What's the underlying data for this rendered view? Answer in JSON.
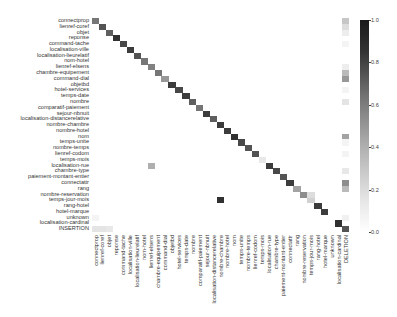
{
  "chart_data": {
    "type": "heatmap",
    "title": "",
    "xlabel": "",
    "ylabel": "",
    "rows": [
      "connectprop",
      "lienref-coref",
      "objet",
      "reponse",
      "command-tache",
      "localisation-ville",
      "localisation-lieurelatif",
      "nom-hotel",
      "lienref-elsens",
      "chambre-equipement",
      "command-dial",
      "objetbd",
      "hotel-services",
      "temps-date",
      "nombre",
      "comparatif-paiement",
      "sejour-nbnuit",
      "localisation-distancerelative",
      "nombre-chambre",
      "nombre-hotel",
      "nom",
      "temps-unite",
      "nombre-temps",
      "lienref-codom",
      "temps-mois",
      "localisation-rue",
      "chambre-type",
      "paiement-montant-entier",
      "connectattr",
      "rang",
      "nombre-reservation",
      "temps-jour-mois",
      "rang-hotel",
      "hotel-marque",
      "unknown",
      "localisation-cardinal",
      "INSERTION"
    ],
    "columns": [
      "connectprop",
      "lienref-coref",
      "objet",
      "reponse",
      "command-tache",
      "localisation-ville",
      "localisation-lieurelatif",
      "nom-hotel",
      "lienref-elsens",
      "chambre-equipement",
      "command-dial",
      "objetbd",
      "hotel-services",
      "temps-date",
      "nombre",
      "comparatif-paiement",
      "sejour-nbnuit",
      "localisation-distancerelative",
      "nombre-chambre",
      "nombre-hotel",
      "nom",
      "temps-unite",
      "nombre-temps",
      "lienref-codom",
      "temps-mois",
      "localisation-rue",
      "chambre-type",
      "paiement-montant-entier",
      "connectattr",
      "rang",
      "nombre-reservation",
      "temps-jour-mois",
      "rang-hotel",
      "hotel-marque",
      "unknown",
      "localisation-cardinal",
      "DELETION"
    ],
    "diagonal": [
      0.6,
      0.75,
      0.7,
      0.9,
      0.8,
      0.85,
      0.75,
      0.6,
      0.55,
      0.6,
      0.45,
      0.85,
      0.8,
      0.85,
      0.7,
      0.6,
      0.85,
      0.7,
      0.85,
      0.85,
      0.9,
      0.8,
      0.75,
      0.75,
      0.1,
      0.85,
      0.8,
      0.75,
      0.85,
      0.4,
      0.5,
      0.2,
      0.85,
      0.85,
      0.0,
      0.9,
      0.0
    ],
    "off_diagonal": [
      {
        "row": "localisation-rue",
        "col": "lienref-elsens",
        "value": 0.35
      },
      {
        "row": "temps-jour-mois",
        "col": "nombre-chambre",
        "value": 0.9
      },
      {
        "row": "nombre-reservation",
        "col": "temps-jour-mois",
        "value": 0.15
      },
      {
        "row": "unknown",
        "col": "connectprop",
        "value": 0.05
      },
      {
        "row": "INSERTION",
        "col": "connectprop",
        "value": 0.12
      },
      {
        "row": "INSERTION",
        "col": "lienref-coref",
        "value": 0.12
      },
      {
        "row": "INSERTION",
        "col": "objet",
        "value": 0.1
      },
      {
        "row": "INSERTION",
        "col": "DELETION",
        "value": 0.75
      },
      {
        "row": "connectprop",
        "col": "DELETION",
        "value": 0.25
      },
      {
        "row": "lienref-coref",
        "col": "DELETION",
        "value": 0.15
      },
      {
        "row": "objet",
        "col": "DELETION",
        "value": 0.08
      },
      {
        "row": "command-tache",
        "col": "DELETION",
        "value": 0.05
      },
      {
        "row": "lienref-elsens",
        "col": "DELETION",
        "value": 0.08
      },
      {
        "row": "chambre-equipement",
        "col": "DELETION",
        "value": 0.3
      },
      {
        "row": "command-dial",
        "col": "DELETION",
        "value": 0.45
      },
      {
        "row": "hotel-services",
        "col": "DELETION",
        "value": 0.05
      },
      {
        "row": "nombre",
        "col": "DELETION",
        "value": 0.12
      },
      {
        "row": "nom",
        "col": "DELETION",
        "value": 0.4
      },
      {
        "row": "temps-unite",
        "col": "DELETION",
        "value": 0.05
      },
      {
        "row": "lienref-codom",
        "col": "DELETION",
        "value": 0.05
      },
      {
        "row": "chambre-type",
        "col": "DELETION",
        "value": 0.1
      },
      {
        "row": "connectattr",
        "col": "DELETION",
        "value": 0.5
      },
      {
        "row": "rang",
        "col": "DELETION",
        "value": 0.3
      },
      {
        "row": "unknown",
        "col": "DELETION",
        "value": 0.06
      }
    ],
    "colorbar": {
      "min": 0.0,
      "max": 1.0,
      "ticks": [
        "0.0",
        "0.2",
        "0.4",
        "0.6",
        "0.8",
        "1.0"
      ]
    },
    "grid": false
  }
}
